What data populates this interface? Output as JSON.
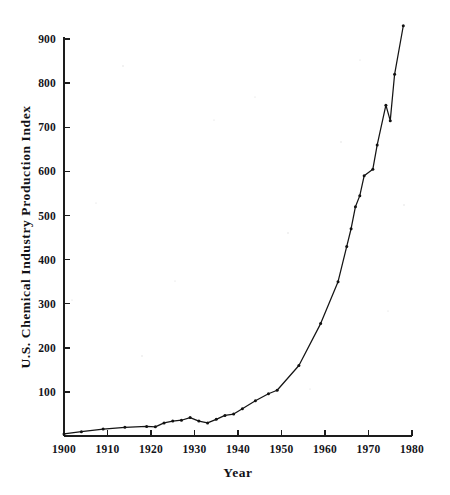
{
  "chart_data": {
    "type": "line",
    "title": "",
    "subtitle": "",
    "xlabel": "Year",
    "ylabel": "U.S. Chemical Industry Production Index",
    "xlim": [
      1900,
      1980
    ],
    "ylim": [
      0,
      950
    ],
    "grid": false,
    "legend": null,
    "legend_position": "none",
    "xticks": [
      1900,
      1910,
      1920,
      1930,
      1940,
      1950,
      1960,
      1970,
      1980
    ],
    "xtick_labels": [
      "1900",
      "1910",
      "1920",
      "1930",
      "1940",
      "1950",
      "1960",
      "1970",
      "1980"
    ],
    "yticks": [
      100,
      200,
      300,
      400,
      500,
      600,
      700,
      800,
      900
    ],
    "ytick_labels": [
      "100",
      "200",
      "300",
      "400",
      "500",
      "600",
      "700",
      "800",
      "900"
    ],
    "marker": "dot",
    "line_color": "#141414",
    "series": [
      {
        "name": "U.S. Chemical Industry Production Index",
        "x": [
          1900,
          1904,
          1909,
          1914,
          1919,
          1921,
          1923,
          1925,
          1927,
          1929,
          1931,
          1933,
          1935,
          1937,
          1939,
          1941,
          1944,
          1947,
          1949,
          1954,
          1959,
          1963,
          1965,
          1966,
          1967,
          1968,
          1969,
          1971,
          1972,
          1974,
          1975,
          1976,
          1978
        ],
        "values": [
          5,
          10,
          16,
          20,
          22,
          21,
          30,
          34,
          36,
          42,
          34,
          30,
          38,
          47,
          50,
          62,
          80,
          96,
          104,
          160,
          255,
          350,
          430,
          470,
          520,
          545,
          590,
          605,
          660,
          750,
          715,
          820,
          930
        ]
      }
    ],
    "annotations": []
  },
  "figure": {
    "background_color": "#ffffff",
    "axis_color": "#1d1d1d",
    "text_color": "#15151a"
  }
}
